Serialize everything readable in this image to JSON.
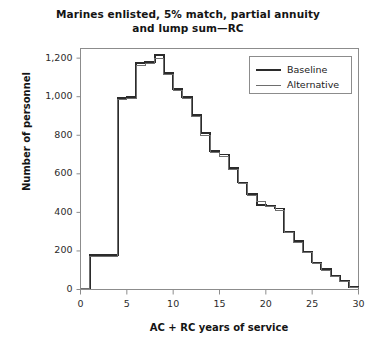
{
  "chart_data": {
    "type": "line",
    "title": "Marines enlisted, 5% match, partial annuity and lump sum—RC",
    "title_line1": "Marines enlisted, 5% match, partial annuity",
    "title_line2": "and lump sum—RC",
    "xlabel": "AC + RC years of service",
    "ylabel": "Number of personnel",
    "xlim": [
      0,
      30
    ],
    "ylim": [
      0,
      1250
    ],
    "xticks": [
      0,
      5,
      10,
      15,
      20,
      25,
      30
    ],
    "xtick_labels": [
      "0",
      "5",
      "10",
      "15",
      "20",
      "25",
      "30"
    ],
    "yticks": [
      0,
      200,
      400,
      600,
      800,
      1000,
      1200
    ],
    "ytick_labels": [
      "0",
      "200",
      "400",
      "600",
      "800",
      "1,000",
      "1,200"
    ],
    "grid": false,
    "legend_position": "top-right",
    "drawstyle": "steps-post",
    "x": [
      0,
      1,
      2,
      3,
      4,
      5,
      6,
      7,
      8,
      9,
      10,
      11,
      12,
      13,
      14,
      15,
      16,
      17,
      18,
      19,
      20,
      21,
      22,
      23,
      24,
      25,
      26,
      27,
      28,
      29,
      30
    ],
    "series": [
      {
        "name": "Baseline",
        "color": "#2b2b2b",
        "width": 1.9,
        "values": [
          5,
          180,
          178,
          178,
          995,
          998,
          1175,
          1180,
          1215,
          1125,
          1040,
          1000,
          905,
          810,
          720,
          700,
          630,
          555,
          495,
          440,
          435,
          420,
          300,
          250,
          195,
          140,
          105,
          70,
          45,
          12,
          5
        ]
      },
      {
        "name": "Alternative",
        "color": "#6e6e6e",
        "width": 1.0,
        "values": [
          5,
          172,
          170,
          170,
          985,
          990,
          1160,
          1170,
          1200,
          1115,
          1030,
          990,
          895,
          800,
          712,
          690,
          622,
          548,
          488,
          455,
          428,
          412,
          294,
          244,
          190,
          136,
          101,
          67,
          42,
          10,
          4
        ]
      }
    ],
    "legend": [
      {
        "label": "Baseline",
        "color": "#2b2b2b",
        "width": 2.2
      },
      {
        "label": "Alternative",
        "color": "#6e6e6e",
        "width": 1.2
      }
    ]
  },
  "axes": {
    "frame_color": "#8c8c8c",
    "tick_color": "#8c8c8c"
  }
}
